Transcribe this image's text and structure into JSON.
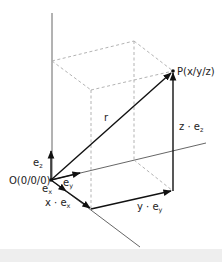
{
  "diagram": {
    "labels": {
      "origin": "O(0/0/0)",
      "point": "P(x/y/z)",
      "r": "r",
      "ez_main": "e",
      "ez_sub": "z",
      "ey_main": "e",
      "ey_sub": "y",
      "ex_main": "e",
      "ex_sub": "x",
      "x_component_main": "x · e",
      "x_component_sub": "x",
      "y_component_main": "y · e",
      "y_component_sub": "y",
      "z_component_main": "z · e",
      "z_component_sub": "z"
    },
    "colors": {
      "axis": "#555555",
      "vector": "#111111",
      "dashed": "#aaaaaa",
      "bottom_bar": "#eeeeee"
    }
  }
}
